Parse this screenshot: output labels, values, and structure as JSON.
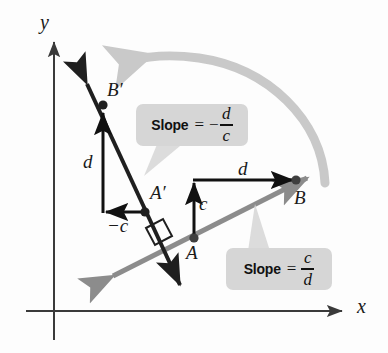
{
  "figure": {
    "background_color": "#fdfdfd"
  },
  "axes": {
    "x_label": "x",
    "y_label": "y",
    "color": "#3a3a3a"
  },
  "lines": [
    {
      "name": "line-AB",
      "label": "gray line through A and B",
      "color": "#8c8c8c",
      "slope_text": "c/d"
    },
    {
      "name": "line-A-prime-B-prime",
      "label": "dark line through A' and B'",
      "color": "#1f1f1f",
      "slope_text": "-d/c"
    }
  ],
  "points": [
    {
      "name": "point-A",
      "label": "A"
    },
    {
      "name": "point-B",
      "label": "B"
    },
    {
      "name": "point-A-prime",
      "label": "A′"
    },
    {
      "name": "point-B-prime",
      "label": "B′"
    }
  ],
  "segments": [
    {
      "name": "segment-c-up",
      "label": "c",
      "direction": "up",
      "color": "#111111"
    },
    {
      "name": "segment-d-right",
      "label": "d",
      "direction": "right",
      "color": "#111111"
    },
    {
      "name": "segment-d-up",
      "label": "d",
      "direction": "up",
      "color": "#111111"
    },
    {
      "name": "segment-neg-c-left",
      "label": "−c",
      "direction": "left",
      "color": "#111111"
    }
  ],
  "callouts": [
    {
      "name": "callout-slope-negative",
      "prefix": "Slope",
      "equals": "=",
      "negative": "−",
      "numerator": "d",
      "denominator": "c",
      "full_text": "Slope = −d/c"
    },
    {
      "name": "callout-slope-positive",
      "prefix": "Slope",
      "equals": "=",
      "negative": "",
      "numerator": "c",
      "denominator": "d",
      "full_text": "Slope = c/d"
    }
  ],
  "annotations": {
    "rotation_arrow": {
      "name": "rotation-arrow",
      "label": "90 degree rotation arc from B to B'",
      "color": "#c9c9c9"
    },
    "right_angle": {
      "name": "right-angle-marker",
      "label": "right angle between the two lines",
      "color": "#1f1f1f"
    }
  }
}
